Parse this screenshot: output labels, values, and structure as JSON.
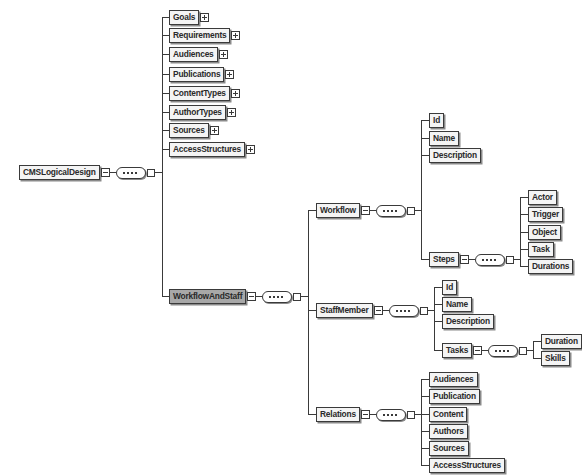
{
  "diagram": {
    "root": {
      "label": "CMSLogicalDesign",
      "expander_icon": "collapse-icon"
    },
    "level1": [
      {
        "label": "Goals",
        "expander_icon": "expand-icon"
      },
      {
        "label": "Requirements",
        "expander_icon": "expand-icon"
      },
      {
        "label": "Audiences",
        "expander_icon": "expand-icon"
      },
      {
        "label": "Publications",
        "expander_icon": "expand-icon"
      },
      {
        "label": "ContentTypes",
        "expander_icon": "expand-icon"
      },
      {
        "label": "AuthorTypes",
        "expander_icon": "expand-icon"
      },
      {
        "label": "Sources",
        "expander_icon": "expand-icon"
      },
      {
        "label": "AccessStructures",
        "expander_icon": "expand-icon"
      },
      {
        "label": "WorkflowAndStaff",
        "expander_icon": "collapse-icon",
        "selected": true
      }
    ],
    "workflow_and_staff_children": [
      {
        "label": "Workflow",
        "expander_icon": "collapse-icon"
      },
      {
        "label": "StaffMember",
        "expander_icon": "collapse-icon"
      },
      {
        "label": "Relations",
        "expander_icon": "collapse-icon"
      }
    ],
    "workflow_children": [
      {
        "label": "Id"
      },
      {
        "label": "Name"
      },
      {
        "label": "Description"
      },
      {
        "label": "Steps",
        "expander_icon": "collapse-icon"
      }
    ],
    "steps_children": [
      {
        "label": "Actor"
      },
      {
        "label": "Trigger"
      },
      {
        "label": "Object"
      },
      {
        "label": "Task"
      },
      {
        "label": "Durations"
      }
    ],
    "staffmember_children": [
      {
        "label": "Id"
      },
      {
        "label": "Name"
      },
      {
        "label": "Description"
      },
      {
        "label": "Tasks",
        "expander_icon": "collapse-icon"
      }
    ],
    "tasks_children": [
      {
        "label": "Duration"
      },
      {
        "label": "Skills"
      }
    ],
    "relations_children": [
      {
        "label": "Audiences"
      },
      {
        "label": "Publication"
      },
      {
        "label": "Content"
      },
      {
        "label": "Authors"
      },
      {
        "label": "Sources"
      },
      {
        "label": "AccessStructures"
      }
    ]
  }
}
